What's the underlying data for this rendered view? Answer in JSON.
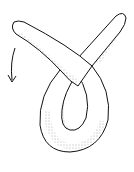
{
  "figure": {
    "arrow_direction": "down",
    "colors": {
      "stroke": "#111111",
      "fill": "#ffffff",
      "stipple": "#333333"
    }
  }
}
